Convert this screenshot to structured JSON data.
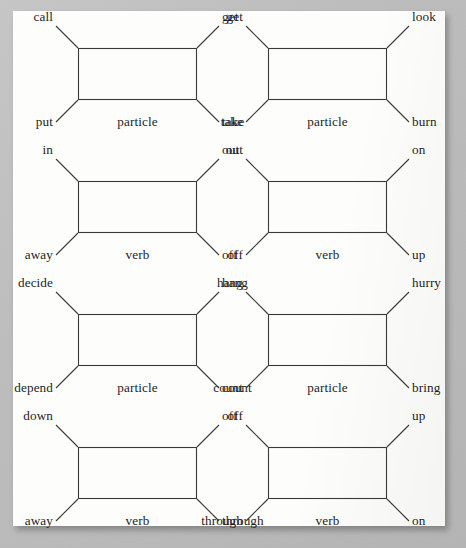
{
  "page": {
    "background_color": "#b9b9b9",
    "paper_color": "#fdfdfc",
    "line_color": "#3b3a38",
    "text_color": "#231f1e",
    "kind": "scanned-book-page"
  },
  "layout": {
    "columns": 2,
    "rows": 4,
    "box_width": 119,
    "box_height": 52,
    "leader_length": 22
  },
  "diagrams": [
    {
      "id": "diagram-1",
      "row": 1,
      "column": 1,
      "box_x": 78,
      "box_y": 48,
      "top_left": "call",
      "top_right": "get",
      "bottom_left": "put",
      "bottom_right": "take",
      "center_label": "particle"
    },
    {
      "id": "diagram-2",
      "row": 1,
      "column": 2,
      "box_x": 268,
      "box_y": 48,
      "top_left": "get",
      "top_right": "look",
      "bottom_left": "take",
      "bottom_right": "burn",
      "center_label": "particle"
    },
    {
      "id": "diagram-3",
      "row": 2,
      "column": 1,
      "box_x": 78,
      "box_y": 181,
      "top_left": "in",
      "top_right": "out",
      "bottom_left": "away",
      "bottom_right": "off",
      "center_label": "verb"
    },
    {
      "id": "diagram-4",
      "row": 2,
      "column": 2,
      "box_x": 268,
      "box_y": 181,
      "top_left": "out",
      "top_right": "on",
      "bottom_left": "off",
      "bottom_right": "up",
      "center_label": "verb"
    },
    {
      "id": "diagram-5",
      "row": 3,
      "column": 1,
      "box_x": 78,
      "box_y": 314,
      "top_left": "decide",
      "top_right": "hang",
      "bottom_left": "depend",
      "bottom_right": "count",
      "center_label": "particle"
    },
    {
      "id": "diagram-6",
      "row": 3,
      "column": 2,
      "box_x": 268,
      "box_y": 314,
      "top_left": "hang",
      "top_right": "hurry",
      "bottom_left": "count",
      "bottom_right": "bring",
      "center_label": "particle"
    },
    {
      "id": "diagram-7",
      "row": 4,
      "column": 1,
      "box_x": 78,
      "box_y": 447,
      "top_left": "down",
      "top_right": "off",
      "bottom_left": "away",
      "bottom_right": "through",
      "center_label": "verb"
    },
    {
      "id": "diagram-8",
      "row": 4,
      "column": 2,
      "box_x": 268,
      "box_y": 447,
      "top_left": "off",
      "top_right": "up",
      "bottom_left": "through",
      "bottom_right": "on",
      "center_label": "verb"
    }
  ]
}
